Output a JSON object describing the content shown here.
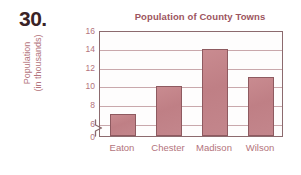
{
  "problem_number": "30.",
  "chart_data": {
    "type": "bar",
    "title": "Population of County Towns",
    "xlabel": "",
    "ylabel_line1": "Population",
    "ylabel_line2": "(in thousands)",
    "categories": [
      "Eaton",
      "Chester",
      "Madison",
      "Wilson"
    ],
    "values": [
      7,
      10,
      14,
      11
    ],
    "ytick_labels": [
      "0",
      "6",
      "8",
      "10",
      "12",
      "14",
      "16"
    ],
    "ylim": [
      0,
      16
    ],
    "axis_break": true,
    "axis_break_between": [
      0,
      6
    ],
    "grid": true,
    "grid_axis": "y",
    "legend": "none",
    "colors": {
      "bar_fill": "#c3868c",
      "bar_border": "#8e5a60",
      "title_text": "#9d5560",
      "tick_text": "#b3737c",
      "gridline": "#c9a8ac",
      "axis_line": "#8c6a6e",
      "problem_number_text": "#3a2326",
      "background": "#ffffff"
    }
  }
}
